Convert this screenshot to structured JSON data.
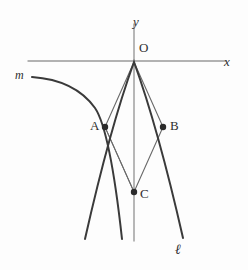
{
  "figure": {
    "background_color": "#fdfdfd",
    "axis_color": "#999999",
    "curve_color": "#3a3a3a",
    "thin_line_color": "#6a6a6a",
    "point_color": "#2b2b2b",
    "label_color": "#2f2f2f"
  },
  "labels": {
    "y_axis": "y",
    "x_axis": "x",
    "origin": "O",
    "point_a": "A",
    "point_b": "B",
    "point_c": "C",
    "curve_m": "m",
    "curve_l": "ℓ"
  },
  "geometry": {
    "origin": {
      "x": 134,
      "y": 62
    },
    "point_a": {
      "x": 105,
      "y": 127
    },
    "point_b": {
      "x": 163,
      "y": 127
    },
    "point_c": {
      "x": 134,
      "y": 192
    },
    "y_axis": {
      "x": 134,
      "y_top": 24,
      "y_bottom": 241
    },
    "x_axis": {
      "y": 61,
      "x_left": 28,
      "x_right": 226
    },
    "parabola_l": "M 85,239 Q 110,128 134,62 Q 158,128 183,238",
    "curve_m": "M 32,77 Q 75,80 95,108 Q 110,130 122,239",
    "chord_oa": "M 134,62 L 105,127",
    "chord_ob": "M 134,62 L 163,127",
    "chord_ac": "M 105,127 L 134,192",
    "chord_bc": "M 163,127 L 134,192",
    "point_radius": 3.2
  }
}
